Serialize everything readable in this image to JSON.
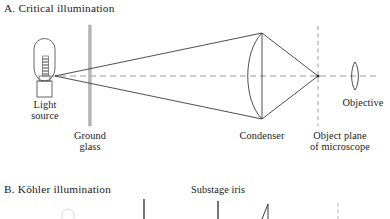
{
  "figure": {
    "background_color": "#ffffff",
    "ink_color": "#1a1a1a",
    "axis_color": "#9a9a9a",
    "element_color": "#b0b0b0"
  },
  "panel_a": {
    "title": "A. Critical illumination",
    "labels": {
      "light_source_line1": "Light",
      "light_source_line2": "source",
      "ground_glass_line1": "Ground",
      "ground_glass_line2": "glass",
      "condenser": "Condenser",
      "object_plane_line1": "Object plane",
      "object_plane_line2": "of microscope",
      "objective": "Objective"
    },
    "optics": {
      "optical_axis_y": 76,
      "lamp_filament_x": 55,
      "ground_glass_x": 90,
      "ground_glass_top": 25,
      "ground_glass_bottom": 126,
      "condenser_x": 262,
      "condenser_top": 33,
      "condenser_bottom": 119,
      "object_plane_x": 318,
      "objective_x": 355
    }
  },
  "panel_b": {
    "title": "B. Köhler illumination",
    "labels": {
      "substage_iris": "Substage iris"
    },
    "optics": {
      "field_stop_x": 144,
      "substage_iris_x": 218,
      "condenser_x": 268,
      "object_plane_x": 338
    }
  }
}
